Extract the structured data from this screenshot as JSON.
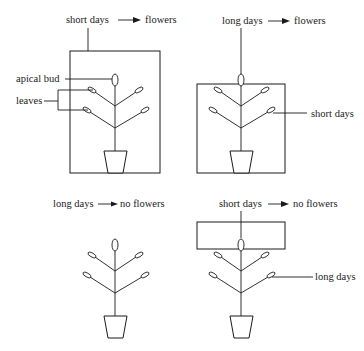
{
  "panels": [
    {
      "id": "panel-1",
      "title": {
        "condition": "short days",
        "result": "flowers"
      },
      "labels": {
        "apical_bud": "apical bud",
        "leaves": "leaves"
      },
      "covered_region": "whole plant"
    },
    {
      "id": "panel-2",
      "title": {
        "condition": "long days",
        "result": "flowers"
      },
      "labels": {
        "side": "short days"
      },
      "covered_region": "leaves"
    },
    {
      "id": "panel-3",
      "title": {
        "condition": "long days",
        "result": "no flowers"
      },
      "covered_region": "none"
    },
    {
      "id": "panel-4",
      "title": {
        "condition": "short days",
        "result": "no flowers"
      },
      "labels": {
        "side": "long days"
      },
      "covered_region": "apical bud"
    }
  ]
}
